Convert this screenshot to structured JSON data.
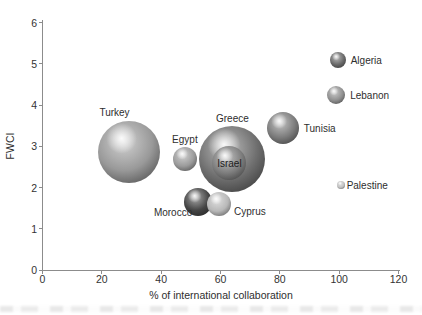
{
  "figure": {
    "background": "#ffffff",
    "axis_color": "#8c8c8c",
    "text_color": "#2e2e2e"
  },
  "chart_data": {
    "type": "scatter",
    "subtype": "bubble",
    "title": "",
    "xlabel": "% of international collaboration",
    "ylabel": "FWCI",
    "xlim": [
      0,
      120
    ],
    "ylim": [
      0,
      6
    ],
    "x_ticks": [
      0,
      20,
      40,
      60,
      80,
      100,
      120
    ],
    "y_ticks": [
      0,
      1,
      2,
      3,
      4,
      5,
      6
    ],
    "grid": false,
    "legend_position": "none",
    "points": [
      {
        "label": "Turkey",
        "x": 29,
        "y": 2.85,
        "r_px": 31,
        "shade": "#999999",
        "label_pos": "above-left"
      },
      {
        "label": "Egypt",
        "x": 48,
        "y": 2.7,
        "r_px": 12,
        "shade": "#9b9b9b",
        "label_pos": "above"
      },
      {
        "label": "Greece",
        "x": 64,
        "y": 2.7,
        "r_px": 33,
        "shade": "#6f6f6f",
        "label_pos": "above"
      },
      {
        "label": "Israel",
        "x": 63,
        "y": 2.6,
        "r_px": 17,
        "shade": "#7d7d7d",
        "label_pos": "center"
      },
      {
        "label": "Morocco",
        "x": 52.5,
        "y": 1.65,
        "r_px": 14,
        "shade": "#454545",
        "label_pos": "below-left"
      },
      {
        "label": "Cyprus",
        "x": 59.5,
        "y": 1.6,
        "r_px": 12,
        "shade": "#b8b8b8",
        "label_pos": "below-right"
      },
      {
        "label": "Tunisia",
        "x": 81,
        "y": 3.45,
        "r_px": 16,
        "shade": "#7c7c7c",
        "label_pos": "right"
      },
      {
        "label": "Algeria",
        "x": 99.5,
        "y": 5.1,
        "r_px": 8,
        "shade": "#696969",
        "label_pos": "right"
      },
      {
        "label": "Lebanon",
        "x": 99,
        "y": 4.25,
        "r_px": 9,
        "shade": "#909090",
        "label_pos": "right"
      },
      {
        "label": "Palestine",
        "x": 100.5,
        "y": 2.05,
        "r_px": 4,
        "shade": "#c2c2c2",
        "label_pos": "right-tight"
      }
    ]
  }
}
